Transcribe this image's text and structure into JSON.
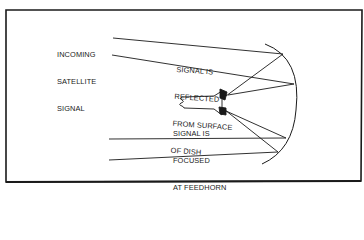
{
  "diagram": {
    "type": "satellite-dish-reflection-diagram",
    "colors": {
      "background": "#ffffff",
      "ink": "#1a1a1a"
    },
    "labels": {
      "incoming": [
        "INCOMING",
        "SATELLITE",
        "SIGNAL"
      ],
      "reflected": [
        "SIGNAL IS",
        "REFLECTED",
        "FROM SURFACE",
        "OF DISH"
      ],
      "focused": [
        "SIGNAL IS",
        "FOCUSED",
        "AT FEEDHORN"
      ]
    },
    "components": [
      "incoming-signal-rays",
      "parabolic-dish",
      "feedhorn",
      "reflected-rays"
    ]
  }
}
